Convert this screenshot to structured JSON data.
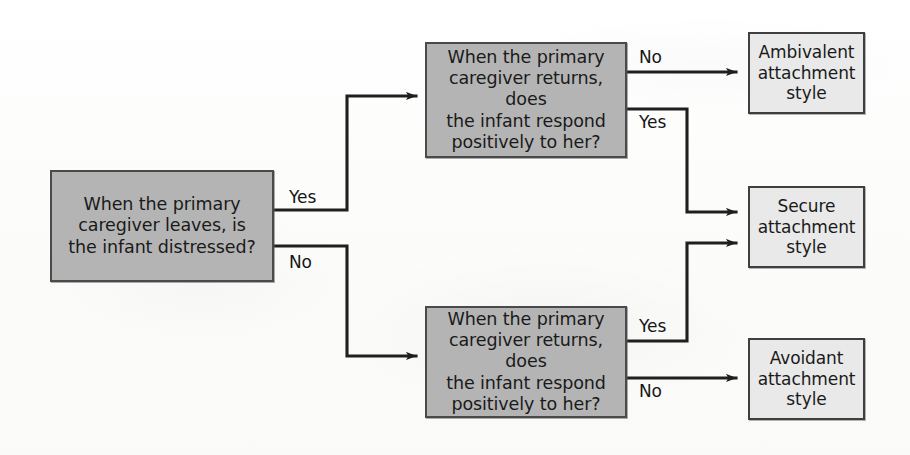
{
  "diagram": {
    "type": "flowchart",
    "background_color": "#fdfdfd",
    "decision_fill": "#b4b4b4",
    "outcome_fill": "#e9e9e9",
    "stroke_color": "#3f3f3f"
  },
  "nodes": {
    "start": {
      "id": "start-question",
      "kind": "decision",
      "text": "When the primary\ncaregiver leaves, is\nthe infant distressed?"
    },
    "top_question": {
      "id": "top-question",
      "kind": "decision",
      "text": "When the primary\ncaregiver returns, does\nthe infant respond\npositively to her?"
    },
    "bottom_question": {
      "id": "bottom-question",
      "kind": "decision",
      "text": "When the primary\ncaregiver returns, does\nthe infant respond\npositively to her?"
    },
    "ambivalent": {
      "id": "ambivalent-outcome",
      "kind": "outcome",
      "text": "Ambivalent\nattachment\nstyle"
    },
    "secure": {
      "id": "secure-outcome",
      "kind": "outcome",
      "text": "Secure\nattachment\nstyle"
    },
    "avoidant": {
      "id": "avoidant-outcome",
      "kind": "outcome",
      "text": "Avoidant\nattachment\nstyle"
    }
  },
  "edges": [
    {
      "id": "start-yes",
      "from": "start",
      "to": "top_question",
      "label": "Yes"
    },
    {
      "id": "start-no",
      "from": "start",
      "to": "bottom_question",
      "label": "No"
    },
    {
      "id": "top-no",
      "from": "top_question",
      "to": "ambivalent",
      "label": "No"
    },
    {
      "id": "top-yes",
      "from": "top_question",
      "to": "secure",
      "label": "Yes"
    },
    {
      "id": "bottom-yes",
      "from": "bottom_question",
      "to": "secure",
      "label": "Yes"
    },
    {
      "id": "bottom-no",
      "from": "bottom_question",
      "to": "avoidant",
      "label": "No"
    }
  ]
}
